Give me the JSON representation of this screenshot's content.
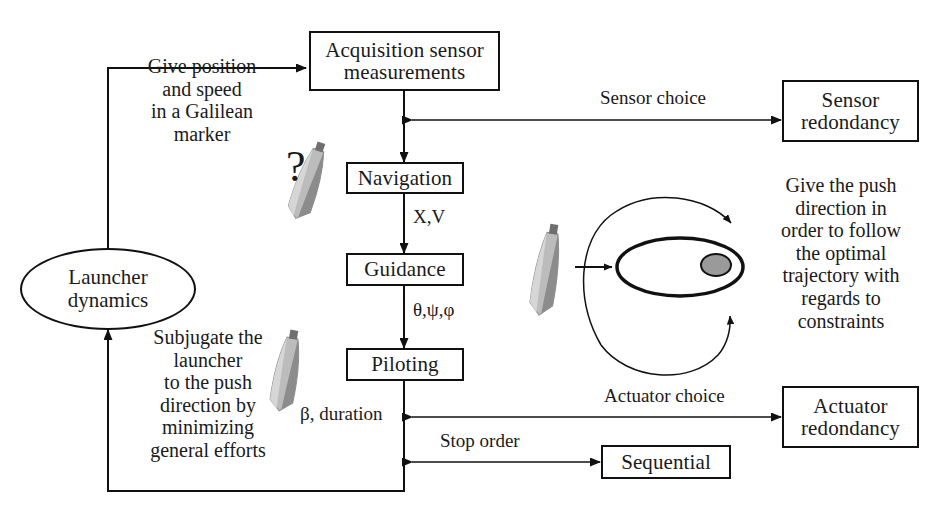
{
  "diagram": {
    "nodes": [
      {
        "id": "acquisition",
        "label": "Acquisition sensor\nmeasurements",
        "shape": "box"
      },
      {
        "id": "navigation",
        "label": "Navigation",
        "shape": "box"
      },
      {
        "id": "guidance",
        "label": "Guidance",
        "shape": "box"
      },
      {
        "id": "piloting",
        "label": "Piloting",
        "shape": "box"
      },
      {
        "id": "sensor_redondancy",
        "label": "Sensor\nredondancy",
        "shape": "box"
      },
      {
        "id": "actuator_redondancy",
        "label": "Actuator\nredondancy",
        "shape": "box"
      },
      {
        "id": "sequential",
        "label": "Sequential",
        "shape": "box"
      },
      {
        "id": "launcher_dynamics",
        "label": "Launcher\ndynamics",
        "shape": "ellipse"
      }
    ],
    "edge_labels": [
      {
        "id": "xv",
        "text": "X,V"
      },
      {
        "id": "angles",
        "text": "θ,ψ,φ"
      },
      {
        "id": "beta_duration",
        "text": "β, duration"
      },
      {
        "id": "sensor_choice",
        "text": "Sensor choice"
      },
      {
        "id": "actuator_choice",
        "text": "Actuator choice"
      },
      {
        "id": "stop_order",
        "text": "Stop order"
      }
    ],
    "annotations": [
      {
        "id": "give_position",
        "text": "Give position\nand speed\nin a Galilean\nmarker"
      },
      {
        "id": "subjugate",
        "text": "Subjugate the\nlauncher\nto the push\ndirection by\nminimizing\ngeneral efforts"
      },
      {
        "id": "push_direction",
        "text": "Give the push\ndirection in\norder to follow\nthe optimal\ntrajectory with\nregards to\nconstraints"
      }
    ],
    "question_mark": "?",
    "colors": {
      "stroke": "#111111",
      "background": "#ffffff",
      "orbit_body_fill": "#9a9a9a",
      "rocket_body": "#b6b6b6",
      "rocket_shade": "#7d7d7d"
    }
  }
}
